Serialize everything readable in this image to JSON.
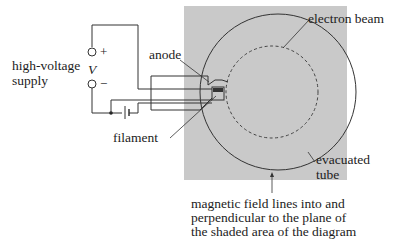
{
  "labels": {
    "supply_line1": "high-voltage",
    "supply_line2": "supply",
    "voltage_symbol": "V",
    "plus": "+",
    "minus": "−",
    "anode": "anode",
    "filament": "filament",
    "electron_beam": "electron beam",
    "evacuated_line1": "evacuated",
    "evacuated_line2": "tube",
    "field_line1": "magnetic field lines into and",
    "field_line2": "perpendicular to the plane of",
    "field_line3": "the shaded area of the diagram"
  },
  "colors": {
    "shaded_area": "#c9c9c9",
    "lines": "#333333",
    "background": "#ffffff"
  }
}
